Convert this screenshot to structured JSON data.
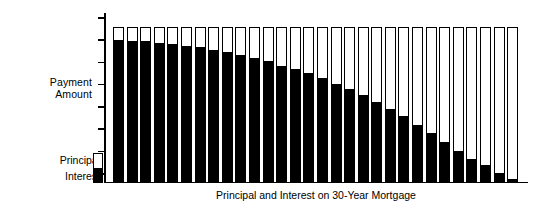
{
  "chart_data": {
    "type": "bar",
    "title": "",
    "caption": "Principal and Interest on 30-Year Mortgage",
    "xlabel": "Principal and Interest on 30-Year Mortgage",
    "ylabel": "Payment Amount",
    "ylabel_lines": [
      "Payment",
      "Amount"
    ],
    "stacked": true,
    "grid": false,
    "legend_position": "left-bottom",
    "axis_tick_count": 8,
    "x_tick_labels": [],
    "y_tick_labels": [],
    "ylim": [
      0,
      100
    ],
    "categories": [
      "1",
      "2",
      "3",
      "4",
      "5",
      "6",
      "7",
      "8",
      "9",
      "10",
      "11",
      "12",
      "13",
      "14",
      "15",
      "16",
      "17",
      "18",
      "19",
      "20",
      "21",
      "22",
      "23",
      "24",
      "25",
      "26",
      "27",
      "28",
      "29",
      "30"
    ],
    "series": [
      {
        "name": "Interest",
        "color": "#000000",
        "values": [
          92,
          91,
          91,
          90,
          89,
          88,
          87,
          85,
          84,
          82,
          80,
          78,
          75,
          73,
          70,
          67,
          63,
          60,
          56,
          51,
          47,
          42,
          36,
          31,
          25,
          19,
          14,
          10,
          5,
          1
        ]
      },
      {
        "name": "Principal",
        "color": "#ffffff",
        "values": [
          8,
          9,
          9,
          10,
          11,
          12,
          13,
          15,
          16,
          18,
          20,
          22,
          25,
          27,
          30,
          33,
          37,
          40,
          44,
          49,
          53,
          58,
          64,
          69,
          75,
          81,
          86,
          90,
          95,
          99
        ]
      }
    ],
    "total_value": 100,
    "legend": [
      {
        "label": "Principal",
        "swatch": "white"
      },
      {
        "label": "Interest",
        "swatch": "black"
      }
    ]
  },
  "colors": {
    "interest": "#000000",
    "principal": "#ffffff",
    "axis": "#000000",
    "background": "#ffffff"
  }
}
